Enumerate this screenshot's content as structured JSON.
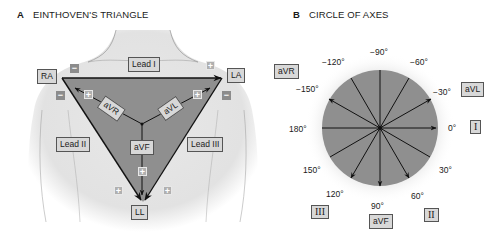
{
  "panel_a": {
    "letter": "A",
    "title": "EINTHOVEN'S TRIANGLE",
    "electrodes": {
      "ra": "RA",
      "la": "LA",
      "ll": "LL"
    },
    "leads": {
      "lead1": "Lead I",
      "lead2": "Lead II",
      "lead3": "Lead III"
    },
    "augmented": {
      "avr": "aVR",
      "avl": "aVL",
      "avf": "aVF"
    },
    "signs": {
      "neg": "−",
      "pos": "+"
    }
  },
  "panel_b": {
    "letter": "B",
    "title": "CIRCLE OF AXES",
    "angles": {
      "m90": "−90°",
      "m120": "−120°",
      "m60": "−60°",
      "m150": "−150°",
      "m30": "−30°",
      "zero": "0°",
      "d180": "180°",
      "d30": "30°",
      "d150": "150°",
      "d60": "60°",
      "d120": "120°",
      "d90": "90°"
    },
    "lead_labels": {
      "avr": "aVR",
      "avl": "aVL",
      "i": "I",
      "ii": "II",
      "iii": "III",
      "avf": "aVF"
    }
  },
  "colors": {
    "skin_fill": "#e6e6e6",
    "triangle_fill": "#8f8f8f",
    "circle_fill": "#8f8f8f",
    "line": "#111111",
    "label_box": "#d8d8d8"
  }
}
